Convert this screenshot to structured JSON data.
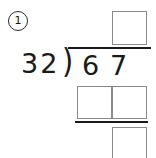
{
  "problem": {
    "number_label": "1",
    "divisor": "32",
    "dividend": "67",
    "dividend_digits": [
      "6",
      "7"
    ],
    "operation_symbol": ")",
    "operation_name": "long-division"
  },
  "boxes": {
    "quotient": [
      {
        "name": "quotient-box-0",
        "value": ""
      }
    ],
    "product": [
      {
        "name": "product-box-0",
        "value": ""
      },
      {
        "name": "product-box-1",
        "value": ""
      }
    ],
    "remainder": [
      {
        "name": "remainder-box-0",
        "value": ""
      }
    ]
  },
  "colors": {
    "ink": "#1a1a1a",
    "box_border": "#8b8b8b",
    "background": "#ffffff"
  }
}
